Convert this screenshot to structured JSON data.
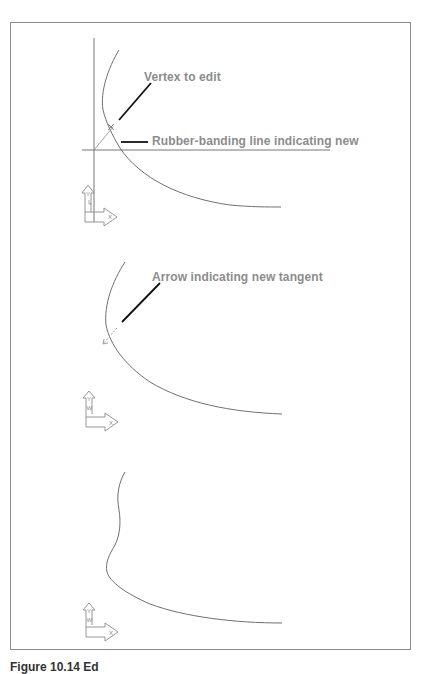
{
  "figure": {
    "panels": [
      {
        "id": "panel-1",
        "labels": [
          {
            "text": "Vertex to edit"
          },
          {
            "text": "Rubber-banding line indicating new"
          }
        ],
        "ucs_icon": {
          "y_label": "Y",
          "x_label": "X"
        }
      },
      {
        "id": "panel-2",
        "labels": [
          {
            "text": "Arrow indicating new tangent"
          }
        ],
        "ucs_icon": {
          "y_label": "Y",
          "w_label": "W",
          "x_label": "X"
        }
      },
      {
        "id": "panel-3",
        "labels": [],
        "ucs_icon": {
          "y_label": "Y",
          "w_label": "W",
          "x_label": "X"
        }
      }
    ],
    "caption": "Figure 10.14   Ed"
  },
  "colors": {
    "frame": "#8a8a8a",
    "curve": "#6f6f6f",
    "label": "#8c8c8c",
    "leader": "#111111"
  }
}
